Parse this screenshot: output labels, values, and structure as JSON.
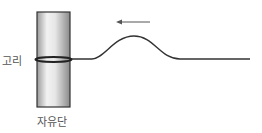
{
  "diagram": {
    "labels": {
      "ring": "고리",
      "free_end": "자유단"
    },
    "elements": {
      "pole": {
        "x": 37,
        "y": 12,
        "width": 33,
        "height": 95,
        "border": "#333333"
      },
      "ring": {
        "y": 59,
        "color": "#222222"
      },
      "string": {
        "color": "#333333",
        "start_x": 70,
        "end_x": 250,
        "baseline_y": 59,
        "pulse_peak_x": 134,
        "pulse_peak_y": 36
      },
      "arrow": {
        "direction": "left",
        "from_x": 150,
        "to_x": 117,
        "y": 22,
        "color": "#555555"
      }
    }
  }
}
